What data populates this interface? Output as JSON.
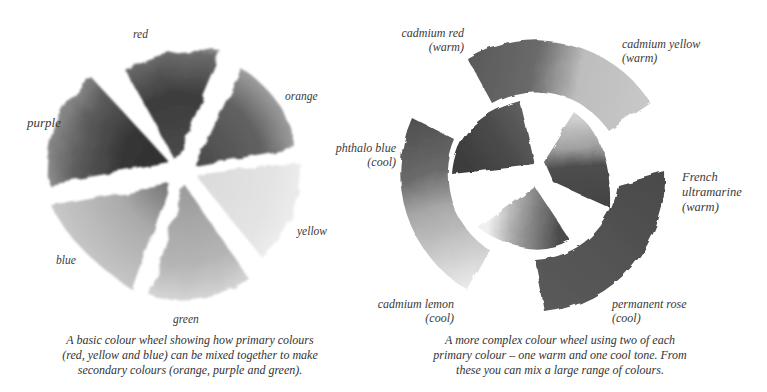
{
  "basic_wheel": {
    "segments": [
      {
        "label": "red",
        "tone": "#3e3e3e"
      },
      {
        "label": "orange",
        "tone": "#5a5a5a"
      },
      {
        "label": "yellow",
        "tone": "#dcdcdc"
      },
      {
        "label": "green",
        "tone": "#a8a8a8"
      },
      {
        "label": "blue",
        "tone": "#b0b0b0"
      },
      {
        "label": "purple",
        "tone": "#3a3a3a"
      }
    ],
    "caption_lines": [
      "A basic colour wheel showing how primary colours",
      "(red, yellow and blue) can be mixed together to make",
      "secondary colours (orange, purple and green)."
    ]
  },
  "complex_wheel": {
    "outer_labels": {
      "cadmium_red": {
        "name": "cadmium red",
        "tone": "(warm)"
      },
      "cadmium_yellow": {
        "name": "cadmium yellow",
        "tone": "(warm)"
      },
      "phthalo_blue": {
        "name": "phthalo blue",
        "tone": "(cool)"
      },
      "french_ultramarine": {
        "name1": "French",
        "name2": "ultramarine",
        "tone": "(warm)"
      },
      "cadmium_lemon": {
        "name": "cadmium lemon",
        "tone": "(cool)"
      },
      "permanent_rose": {
        "name": "permanent rose",
        "tone": "(cool)"
      }
    },
    "caption_lines": [
      "A more complex colour wheel using two of each",
      "primary colour – one warm and one cool tone. From",
      "these you can mix a large range of colours."
    ]
  }
}
